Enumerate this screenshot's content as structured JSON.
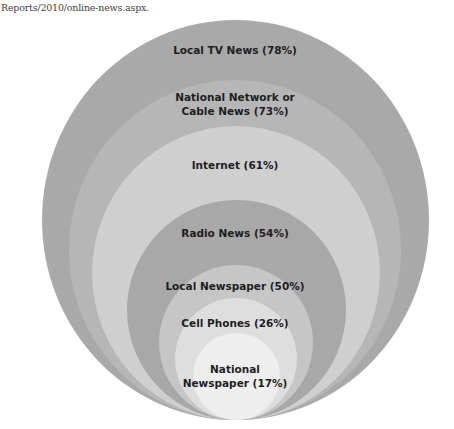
{
  "source_text": "Reports/2010/online-news.aspx.",
  "diagram": {
    "type": "nested-circles",
    "anchor": "bottom-tangent",
    "rings": [
      {
        "label": "Local TV News (78%)",
        "name": "Local TV News",
        "percent": 78,
        "color": "#a9a9a9"
      },
      {
        "label": "National Network or\nCable News (73%)",
        "line1": "National Network or",
        "line2": "Cable News (73%)",
        "name": "National Network or Cable News",
        "percent": 73,
        "color": "#b6b6b6"
      },
      {
        "label": "Internet (61%)",
        "name": "Internet",
        "percent": 61,
        "color": "#cfcfcf"
      },
      {
        "label": "Radio News (54%)",
        "name": "Radio News",
        "percent": 54,
        "color": "#a8a8a8"
      },
      {
        "label": "Local Newspaper (50%)",
        "name": "Local Newspaper",
        "percent": 50,
        "color": "#c6c6c6"
      },
      {
        "label": "Cell Phones (26%)",
        "name": "Cell Phones",
        "percent": 26,
        "color": "#dedede"
      },
      {
        "label": "National\nNewspaper (17%)",
        "line1": "National",
        "line2": "Newspaper (17%)",
        "name": "National Newspaper",
        "percent": 17,
        "color": "#eeeeee"
      }
    ]
  }
}
